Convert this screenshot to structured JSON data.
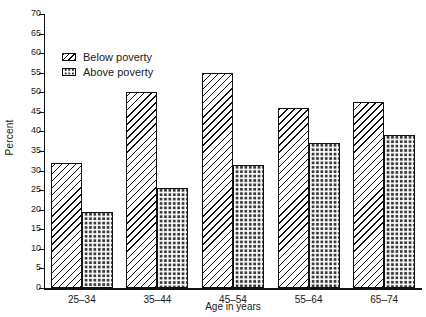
{
  "chart_data": {
    "type": "bar",
    "title": "",
    "xlabel": "Age in years",
    "ylabel": "Percent",
    "categories": [
      "25–34",
      "35–44",
      "45–54",
      "55–64",
      "65–74"
    ],
    "series": [
      {
        "name": "Below poverty",
        "values": [
          32,
          50,
          55,
          46,
          47.5
        ]
      },
      {
        "name": "Above poverty",
        "values": [
          19.5,
          25.5,
          31.5,
          37,
          39
        ]
      }
    ],
    "ylim": [
      0,
      70
    ],
    "ytick_step": 5,
    "yticks": [
      0,
      5,
      10,
      15,
      20,
      25,
      30,
      35,
      40,
      45,
      50,
      55,
      60,
      65,
      70
    ],
    "ytick_labels": [
      "0",
      "5",
      "10",
      "15",
      "20",
      "25",
      "30",
      "35",
      "40",
      "45",
      "50",
      "55",
      "60",
      "65",
      "70"
    ],
    "grid": false,
    "legend_position": "upper-left-inside",
    "colors": {
      "below_poverty": "#ffffff",
      "above_poverty": "#3b3b3b",
      "axis": "#111111",
      "background": "#ffffff"
    }
  },
  "legend": {
    "items": [
      {
        "label": "Below poverty",
        "pattern": "diagonal-hatch"
      },
      {
        "label": "Above poverty",
        "pattern": "dark-checker"
      }
    ]
  }
}
